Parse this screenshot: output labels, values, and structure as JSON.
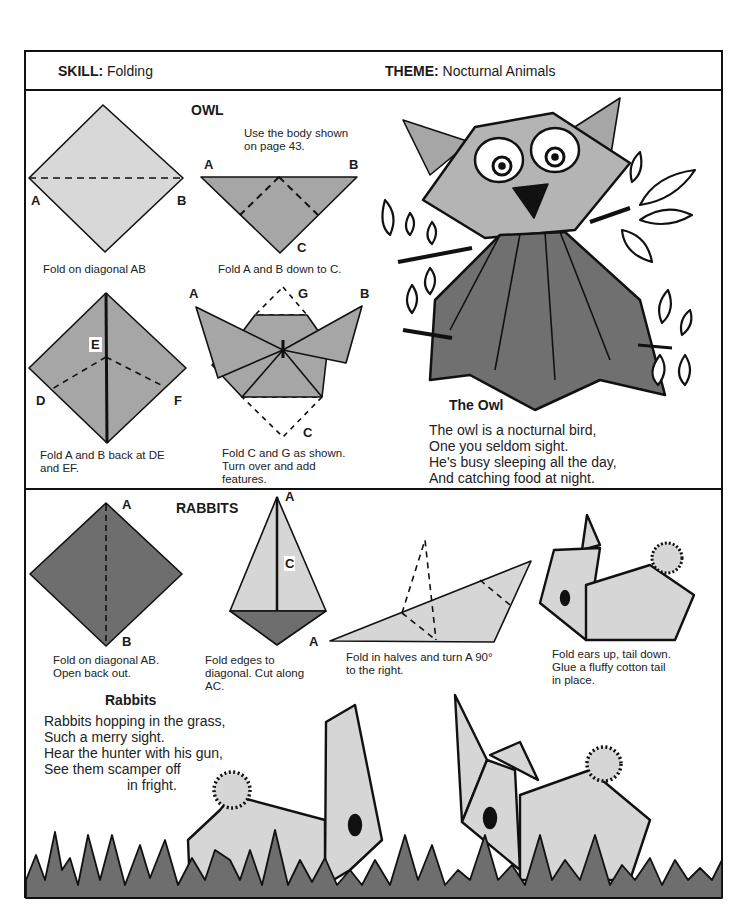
{
  "header": {
    "skill_label": "SKILL:",
    "skill_value": "Folding",
    "theme_label": "THEME:",
    "theme_value": "Nocturnal Animals"
  },
  "owl_section": {
    "title": "OWL",
    "note": [
      "Use the body shown",
      "on page 43."
    ],
    "steps": [
      {
        "caption": [
          "Fold on diagonal AB"
        ],
        "labels": [
          "A",
          "B"
        ]
      },
      {
        "caption": [
          "Fold A and B down to C."
        ],
        "labels": [
          "A",
          "B",
          "C"
        ]
      },
      {
        "caption": [
          "Fold A and B back at DE",
          "and EF."
        ],
        "labels": [
          "E",
          "D",
          "F"
        ]
      },
      {
        "caption": [
          "Fold C and G as shown.",
          "Turn over and add",
          "features."
        ],
        "labels": [
          "A",
          "G",
          "B",
          "C"
        ]
      }
    ],
    "poem_title": "The Owl",
    "poem": [
      "The owl is a nocturnal bird,",
      "One you seldom sight.",
      "He's busy sleeping all the day,",
      "And catching food at night."
    ]
  },
  "rabbits_section": {
    "title": "RABBITS",
    "steps": [
      {
        "caption": [
          "Fold on diagonal AB.",
          "Open back out."
        ],
        "labels": [
          "A",
          "B"
        ]
      },
      {
        "caption": [
          "Fold edges to",
          "diagonal. Cut along",
          "AC."
        ],
        "labels": [
          "A",
          "C"
        ]
      },
      {
        "caption": [
          "Fold in halves and turn A 90°",
          "to the right."
        ],
        "labels": [
          "A"
        ]
      },
      {
        "caption": [
          "Fold ears up, tail down.",
          "Glue a fluffy cotton tail",
          "in place."
        ],
        "labels": []
      }
    ],
    "poem_title": "Rabbits",
    "poem": [
      "Rabbits hopping in the grass,",
      "Such a merry sight.",
      "Hear the hunter with his gun,",
      "See them scamper off",
      "in fright."
    ]
  },
  "colors": {
    "light_fill": "#d6d6d6",
    "mid_fill": "#a8a8a8",
    "dark_fill": "#6e6e6e",
    "line": "#111111"
  }
}
